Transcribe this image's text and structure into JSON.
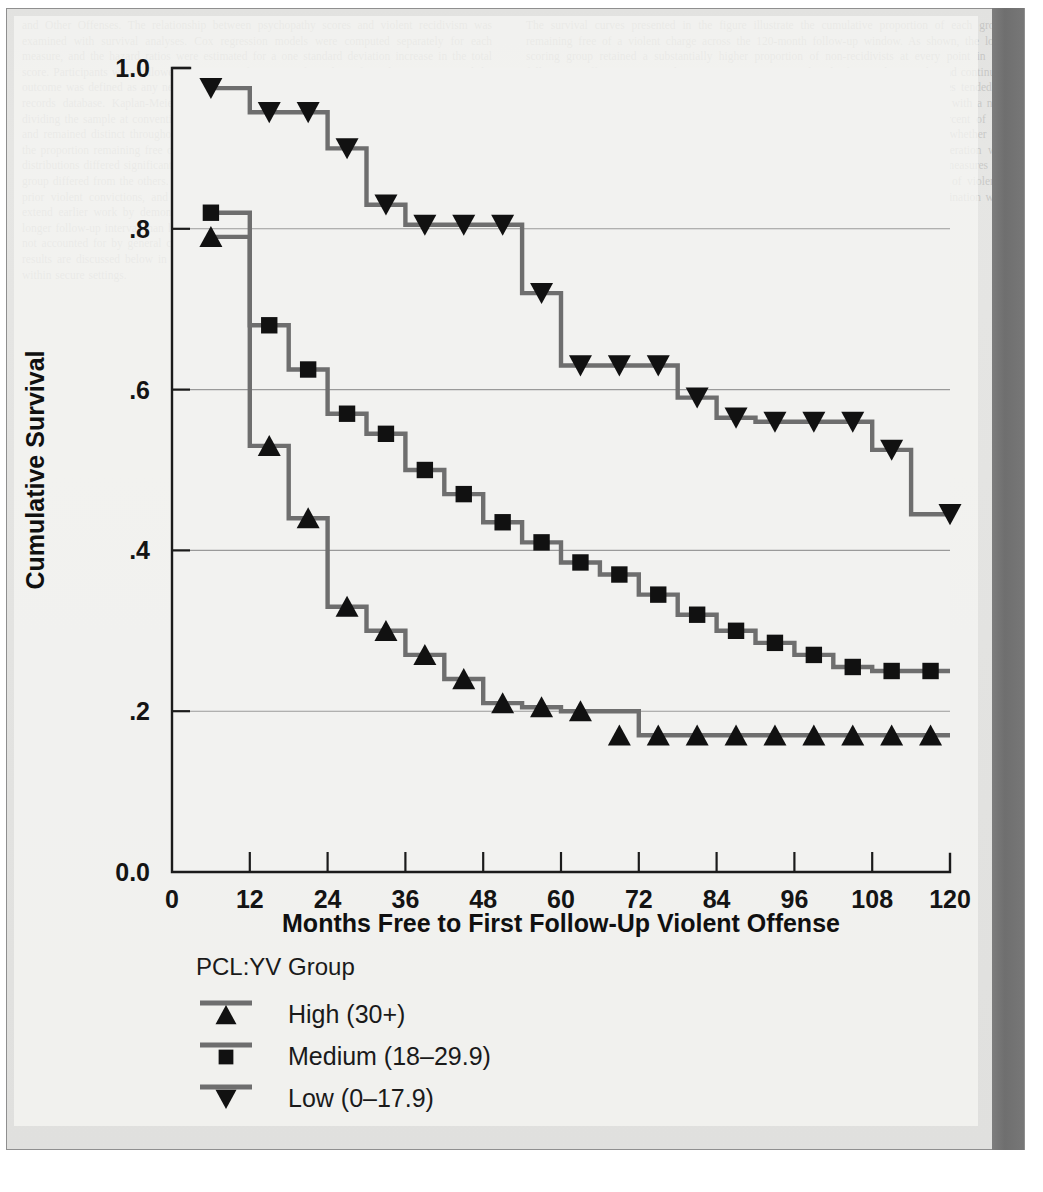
{
  "page": {
    "background_color": "#e3e3e1",
    "right_bar_color": "#747474",
    "ghost_text_left": "and Other Offenses. The relationship between psychopathy scores and violent recidivism was examined with survival analyses. Cox regression models were computed separately for each measure, and the hazard ratios were estimated for a one standard deviation increase in the total score. Participants were followed for a mean of 10 years after release from the institution, and the outcome was defined as any new charge for a violent offense as recorded in the national criminal records database. Kaplan-Meier survival curves were plotted for the three groups formed by dividing the sample at conventional cut scores. The curves separated early in the follow-up period and remained distinct throughout, with the high-scoring group showing the most rapid decline in the proportion remaining free of a violent charge. A log-rank test indicated that the three survival distributions differed significantly from one another, and pairwise comparisons confirmed that each group differed from the others. Importantly, the effect remained after controlling for age at release, prior violent convictions, and the number of previous institutional placements. These findings extend earlier work by demonstrating that the predictive relationship holds over a substantially longer follow-up interval than has typically been reported in the adolescent literature, and that it is not accounted for by general criminal history variables alone. The practical implications of these results are discussed below in terms of risk assessment and the allocation of treatment resources within secure settings.",
    "ghost_text_right": "The survival curves presented in the figure illustrate the cumulative proportion of each group remaining free of a violent charge across the 120-month follow-up window. As shown, the low-scoring group retained a substantially higher proportion of non-recidivists at every point in the follow-up. Differences among the groups were apparent within the first twelve months and continued to widen through approximately sixty months, after which the high and medium curves tended to flatten. Approximately eighty-three percent of the high-scoring group had been charged with a new violent offense by the end of the follow-up, compared with roughly seventy-five percent of the medium group and fifty-five percent of the low group. Additional analyses examined whether the relationship varied as a function of the index offense type, and no significant moderation was detected. Taken together, these results support the continued use of structured measures of psychopathic traits as one component of a comprehensive approach to the assessment of violence risk in adolescent offenders, provided that scores are interpreted cautiously and in combination with other empirically supported risk factors."
  },
  "chart_data": {
    "type": "line",
    "subtype": "kaplan-meier-step",
    "title": "",
    "xlabel": "Months Free to First Follow-Up Violent Offense",
    "ylabel": "Cumulative Survival",
    "xlim": [
      0,
      120
    ],
    "ylim": [
      0.0,
      1.0
    ],
    "xticks": [
      0,
      12,
      24,
      36,
      48,
      60,
      72,
      84,
      96,
      108,
      120
    ],
    "xtick_labels": [
      "0",
      "12",
      "24",
      "36",
      "48",
      "60",
      "72",
      "84",
      "96",
      "108",
      "120"
    ],
    "yticks": [
      0.0,
      0.2,
      0.4,
      0.6,
      0.8,
      1.0
    ],
    "ytick_labels": [
      "0.0",
      ".2",
      ".4",
      ".6",
      ".8",
      "1.0"
    ],
    "grid": "horizontal",
    "gridlines_at": [
      0.2,
      0.4,
      0.6,
      0.8
    ],
    "line_color": "#6e6e6e",
    "marker_color": "#111111",
    "legend": {
      "title": "PCL:YV Group",
      "position": "below-axes-left",
      "entries": [
        {
          "label": "High (30+)",
          "marker": "triangle-up",
          "series": "high"
        },
        {
          "label": "Medium (18–29.9)",
          "marker": "square",
          "series": "medium"
        },
        {
          "label": "Low (0–17.9)",
          "marker": "triangle-down",
          "series": "low"
        }
      ]
    },
    "series": [
      {
        "name": "High (30+)",
        "marker": "triangle-up",
        "x": [
          6,
          15,
          21,
          27,
          33,
          39,
          45,
          51,
          57,
          63,
          69,
          75,
          81,
          87,
          93,
          99,
          105,
          111,
          117
        ],
        "y": [
          0.79,
          0.53,
          0.44,
          0.33,
          0.3,
          0.27,
          0.24,
          0.21,
          0.205,
          0.2,
          0.17,
          0.17,
          0.17,
          0.17,
          0.17,
          0.17,
          0.17,
          0.17,
          0.17
        ],
        "step_x": [
          6,
          12,
          18,
          24,
          30,
          36,
          42,
          48,
          54,
          60,
          66,
          72,
          120
        ],
        "step_y": [
          0.79,
          0.53,
          0.44,
          0.33,
          0.3,
          0.27,
          0.24,
          0.21,
          0.205,
          0.2,
          0.2,
          0.17,
          0.17
        ]
      },
      {
        "name": "Medium (18–29.9)",
        "marker": "square",
        "x": [
          6,
          15,
          21,
          27,
          33,
          39,
          45,
          51,
          57,
          63,
          69,
          75,
          81,
          87,
          93,
          99,
          105,
          111,
          117
        ],
        "y": [
          0.82,
          0.68,
          0.625,
          0.57,
          0.545,
          0.5,
          0.47,
          0.435,
          0.41,
          0.385,
          0.37,
          0.345,
          0.32,
          0.3,
          0.285,
          0.27,
          0.255,
          0.25,
          0.25
        ],
        "step_x": [
          6,
          12,
          18,
          24,
          30,
          36,
          42,
          48,
          54,
          60,
          66,
          72,
          78,
          84,
          90,
          96,
          102,
          108,
          120
        ],
        "step_y": [
          0.82,
          0.68,
          0.625,
          0.57,
          0.545,
          0.5,
          0.47,
          0.435,
          0.41,
          0.385,
          0.37,
          0.345,
          0.32,
          0.3,
          0.285,
          0.27,
          0.255,
          0.25,
          0.25
        ]
      },
      {
        "name": "Low (0–17.9)",
        "marker": "triangle-down",
        "x": [
          6,
          15,
          21,
          27,
          33,
          39,
          45,
          51,
          57,
          63,
          69,
          75,
          81,
          87,
          93,
          99,
          105,
          111,
          120
        ],
        "y": [
          0.975,
          0.945,
          0.945,
          0.9,
          0.83,
          0.805,
          0.805,
          0.805,
          0.72,
          0.63,
          0.63,
          0.63,
          0.59,
          0.565,
          0.56,
          0.56,
          0.56,
          0.525,
          0.445
        ],
        "step_x": [
          6,
          12,
          18,
          24,
          30,
          36,
          42,
          48,
          54,
          60,
          66,
          72,
          78,
          84,
          90,
          96,
          102,
          108,
          114,
          120
        ],
        "step_y": [
          0.975,
          0.945,
          0.945,
          0.9,
          0.83,
          0.805,
          0.805,
          0.805,
          0.72,
          0.63,
          0.63,
          0.63,
          0.59,
          0.565,
          0.56,
          0.56,
          0.56,
          0.525,
          0.445,
          0.445
        ]
      }
    ]
  }
}
